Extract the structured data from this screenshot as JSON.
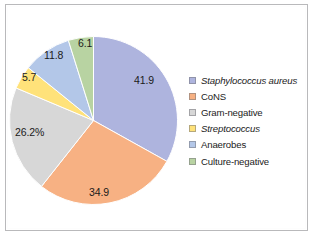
{
  "chart_data": {
    "type": "pie",
    "title": "",
    "subtitle": "",
    "xlabel": "",
    "ylabel": "",
    "grid": false,
    "legend_position": "right",
    "value_suffix": "%",
    "start_angle_deg": 0,
    "direction": "clockwise",
    "note": "Values are percentages of cases; categories overlap so the total exceeds 100.",
    "total_of_values": 126.6,
    "categories": [
      "Staphylococcus aureus",
      "CoNS",
      "Gram-negative",
      "Streptococcus",
      "Anaerobes",
      "Culture-negative"
    ],
    "values": [
      41.9,
      34.9,
      26.2,
      5.7,
      11.8,
      6.1
    ],
    "data_labels": [
      "41.9",
      "34.9",
      "26.2%",
      "5.7",
      "11.8",
      "6.1"
    ],
    "colors": [
      "#aeb4de",
      "#f7b183",
      "#d7d7d7",
      "#ffe27a",
      "#b3c7e8",
      "#b8d3a2"
    ],
    "slices": [
      {
        "name": "Staphylococcus aureus",
        "value": 41.9,
        "label": "41.9",
        "color": "#aeb4de",
        "italic_legend": true,
        "start_deg": 0,
        "sweep_deg": 119.1,
        "label_x": 134,
        "label_y": 74
      },
      {
        "name": "CoNS",
        "value": 34.9,
        "label": "34.9",
        "color": "#f7b183",
        "italic_legend": false,
        "start_deg": 119.1,
        "sweep_deg": 99.2,
        "label_x": 89,
        "label_y": 186
      },
      {
        "name": "Gram-negative",
        "value": 26.2,
        "label": "26.2%",
        "color": "#d7d7d7",
        "italic_legend": false,
        "start_deg": 218.3,
        "sweep_deg": 74.5,
        "label_x": 15,
        "label_y": 126
      },
      {
        "name": "Streptococcus",
        "value": 5.7,
        "label": "5.7",
        "color": "#ffe27a",
        "italic_legend": true,
        "start_deg": 292.8,
        "sweep_deg": 16.2,
        "label_x": 22,
        "label_y": 71
      },
      {
        "name": "Anaerobes",
        "value": 11.8,
        "label": "11.8",
        "color": "#b3c7e8",
        "italic_legend": false,
        "start_deg": 309.0,
        "sweep_deg": 33.6,
        "label_x": 44,
        "label_y": 49
      },
      {
        "name": "Culture-negative",
        "value": 6.1,
        "label": "6.1",
        "color": "#b8d3a2",
        "italic_legend": false,
        "start_deg": 342.6,
        "sweep_deg": 17.4,
        "label_x": 78,
        "label_y": 37
      }
    ]
  },
  "legend": {
    "items": [
      {
        "label": "Staphylococcus aureus",
        "color": "#aeb4de",
        "italic": true
      },
      {
        "label": "CoNS",
        "color": "#f7b183",
        "italic": false
      },
      {
        "label": "Gram-negative",
        "color": "#d7d7d7",
        "italic": false
      },
      {
        "label": "Streptococcus",
        "color": "#ffe27a",
        "italic": true
      },
      {
        "label": "Anaerobes",
        "color": "#b3c7e8",
        "italic": false
      },
      {
        "label": "Culture-negative",
        "color": "#b8d3a2",
        "italic": false
      }
    ]
  }
}
